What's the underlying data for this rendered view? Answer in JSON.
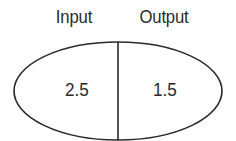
{
  "diagram": {
    "type": "function-machine-ellipse",
    "labels": {
      "input": "Input",
      "output": "Output"
    },
    "values": {
      "input": "2.5",
      "output": "1.5"
    },
    "stroke_color": "#2a2a2a",
    "background": "#ffffff"
  }
}
